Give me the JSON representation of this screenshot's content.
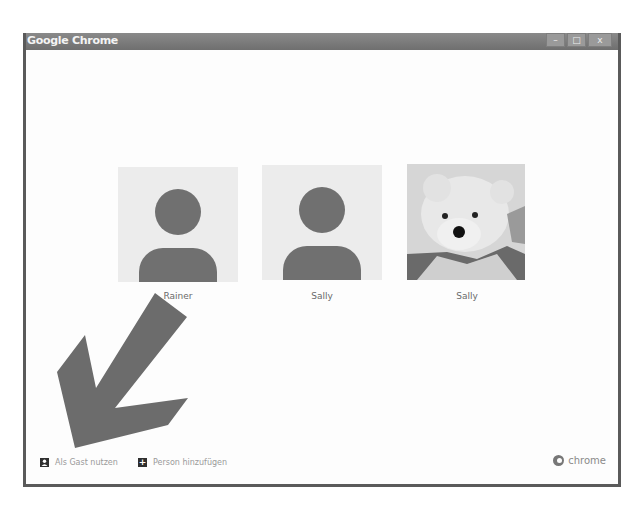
{
  "window": {
    "title": "Google Chrome",
    "controls": {
      "minimize": "–",
      "maximize": "□",
      "close": "x"
    }
  },
  "profiles": [
    {
      "name": "Rainer",
      "avatar": "default-person-icon"
    },
    {
      "name": "Sally",
      "avatar": "default-person-icon"
    },
    {
      "name": "Sally",
      "avatar": "teddy-bear-photo"
    }
  ],
  "footer": {
    "guest_label": "Als Gast nutzen",
    "add_person_label": "Person hinzufügen",
    "add_person_icon": "+",
    "brand_label": "chrome"
  },
  "annotation": {
    "type": "arrow",
    "color": "#707070",
    "points_to": "Als Gast nutzen"
  }
}
